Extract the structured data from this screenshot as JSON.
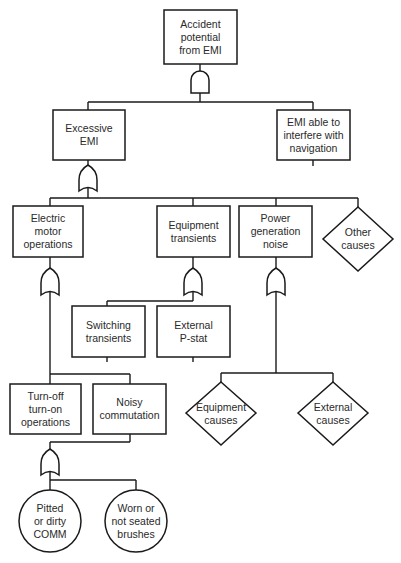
{
  "diagram": {
    "type": "fault-tree",
    "top_event": {
      "id": "top",
      "label": "Accident\npotential\nfrom EMI",
      "shape": "rectangle",
      "gate": "AND"
    },
    "nodes": [
      {
        "id": "excessive_emi",
        "label": "Excessive\nEMI",
        "shape": "rectangle",
        "gate": "OR",
        "parent": "top"
      },
      {
        "id": "emi_interfere",
        "label": "EMI able to\ninterfere with\nnavigation",
        "shape": "rectangle",
        "parent": "top"
      },
      {
        "id": "electric_motor",
        "label": "Electric\nmotor\noperations",
        "shape": "rectangle",
        "gate": "OR",
        "parent": "excessive_emi"
      },
      {
        "id": "equipment_transients",
        "label": "Equipment\ntransients",
        "shape": "rectangle",
        "gate": "OR",
        "parent": "excessive_emi"
      },
      {
        "id": "power_generation",
        "label": "Power\ngeneration\nnoise",
        "shape": "rectangle",
        "gate": "OR",
        "parent": "excessive_emi"
      },
      {
        "id": "other_causes",
        "label": "Other\ncauses",
        "shape": "diamond",
        "parent": "excessive_emi"
      },
      {
        "id": "switching_transients",
        "label": "Switching\ntransients",
        "shape": "rectangle",
        "parent": "equipment_transients"
      },
      {
        "id": "external_pstat",
        "label": "External\nP-stat",
        "shape": "rectangle",
        "parent": "equipment_transients"
      },
      {
        "id": "equipment_causes",
        "label": "Equipment\ncauses",
        "shape": "diamond",
        "parent": "power_generation"
      },
      {
        "id": "external_causes",
        "label": "External\ncauses",
        "shape": "diamond",
        "parent": "power_generation"
      },
      {
        "id": "turn_off_on",
        "label": "Turn-off\nturn-on\noperations",
        "shape": "rectangle",
        "parent": "electric_motor"
      },
      {
        "id": "noisy_commutation",
        "label": "Noisy\ncommutation",
        "shape": "rectangle",
        "gate": "OR",
        "parent": "electric_motor"
      },
      {
        "id": "pitted_comm",
        "label": "Pitted\nor dirty\nCOMM",
        "shape": "circle",
        "parent": "noisy_commutation"
      },
      {
        "id": "worn_brushes",
        "label": "Worn or\nnot seated\nbrushes",
        "shape": "circle",
        "parent": "noisy_commutation"
      }
    ],
    "gates": [
      {
        "id": "gate_top",
        "type": "AND",
        "under": "top"
      },
      {
        "id": "gate_excessive",
        "type": "OR",
        "under": "excessive_emi"
      },
      {
        "id": "gate_motor",
        "type": "OR",
        "under": "electric_motor"
      },
      {
        "id": "gate_equipment",
        "type": "OR",
        "under": "equipment_transients"
      },
      {
        "id": "gate_power",
        "type": "OR",
        "under": "power_generation"
      },
      {
        "id": "gate_noisy",
        "type": "OR",
        "under": "noisy_commutation"
      }
    ]
  },
  "labels": {
    "top": "Accident\npotential\nfrom EMI",
    "excessive_emi": "Excessive\nEMI",
    "emi_interfere": "EMI able to\ninterfere with\nnavigation",
    "electric_motor": "Electric\nmotor\noperations",
    "equipment_transients": "Equipment\ntransients",
    "power_generation": "Power\ngeneration\nnoise",
    "other_causes": "Other\ncauses",
    "switching_transients": "Switching\ntransients",
    "external_pstat": "External\nP-stat",
    "equipment_causes": "Equipment\ncauses",
    "external_causes": "External\ncauses",
    "turn_off_on": "Turn-off\nturn-on\noperations",
    "noisy_commutation": "Noisy\ncommutation",
    "pitted_comm": "Pitted\nor dirty\nCOMM",
    "worn_brushes": "Worn or\nnot seated\nbrushes"
  }
}
